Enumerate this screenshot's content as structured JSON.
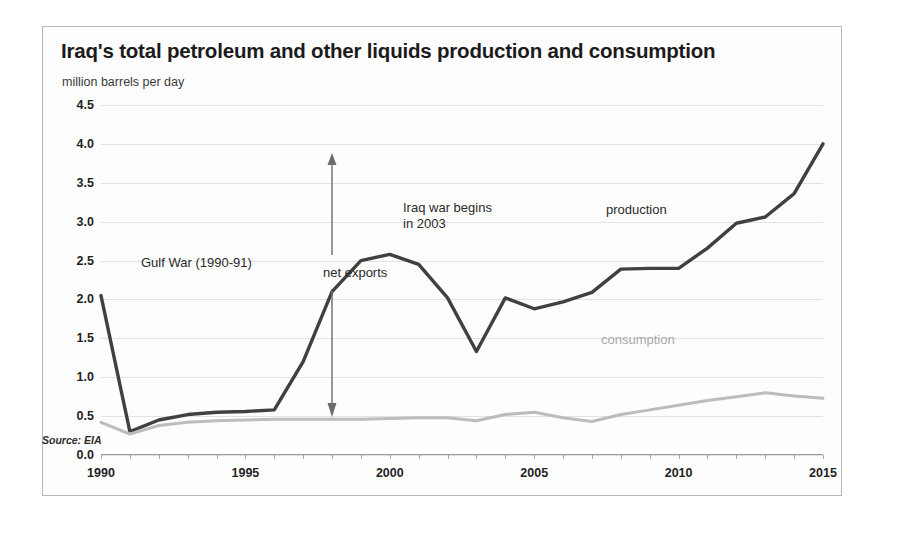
{
  "chart_data": {
    "type": "line",
    "title": "Iraq's total petroleum and other liquids production and consumption",
    "subtitle": "million barrels per day",
    "source": "Source: EIA",
    "xlabel": "",
    "ylabel": "million barrels per day",
    "grid": true,
    "legend_position": "inline-annotation",
    "xlim": [
      1990,
      2015
    ],
    "ylim": [
      0.0,
      4.5
    ],
    "yticks": [
      "4.5",
      "4.0",
      "3.5",
      "3.0",
      "2.5",
      "2.0",
      "1.5",
      "1.0",
      "0.5",
      "0.0"
    ],
    "ytick_values": [
      4.5,
      4.0,
      3.5,
      3.0,
      2.5,
      2.0,
      1.5,
      1.0,
      0.5,
      0.0
    ],
    "xticks": [
      "1990",
      "1995",
      "2000",
      "2005",
      "2010",
      "2015"
    ],
    "xtick_values": [
      1990,
      1995,
      2000,
      2005,
      2010,
      2015
    ],
    "x": [
      1990,
      1991,
      1992,
      1993,
      1994,
      1995,
      1996,
      1997,
      1998,
      1999,
      2000,
      2001,
      2002,
      2003,
      2004,
      2005,
      2006,
      2007,
      2008,
      2009,
      2010,
      2011,
      2012,
      2013,
      2014,
      2015
    ],
    "series": [
      {
        "name": "production",
        "color": "#404040",
        "values": [
          2.05,
          0.3,
          0.45,
          0.52,
          0.55,
          0.56,
          0.58,
          1.2,
          2.1,
          2.5,
          2.58,
          2.45,
          2.02,
          1.33,
          2.02,
          1.88,
          1.97,
          2.09,
          2.39,
          2.4,
          2.4,
          2.66,
          2.98,
          3.06,
          3.36,
          4.0
        ]
      },
      {
        "name": "consumption",
        "color": "#bcbcbc",
        "values": [
          0.42,
          0.27,
          0.38,
          0.42,
          0.44,
          0.45,
          0.46,
          0.46,
          0.46,
          0.46,
          0.47,
          0.48,
          0.48,
          0.44,
          0.52,
          0.55,
          0.48,
          0.43,
          0.52,
          0.58,
          0.64,
          0.7,
          0.75,
          0.8,
          0.76,
          0.73
        ]
      }
    ],
    "annotations": [
      {
        "id": "gulf-war",
        "text": "Gulf War (1990-91)"
      },
      {
        "id": "iraq-war",
        "text": "Iraq war begins\nin 2003"
      },
      {
        "id": "production",
        "text": "production"
      },
      {
        "id": "consumption",
        "text": "consumption"
      },
      {
        "id": "net-exports",
        "text": "net exports"
      }
    ]
  }
}
